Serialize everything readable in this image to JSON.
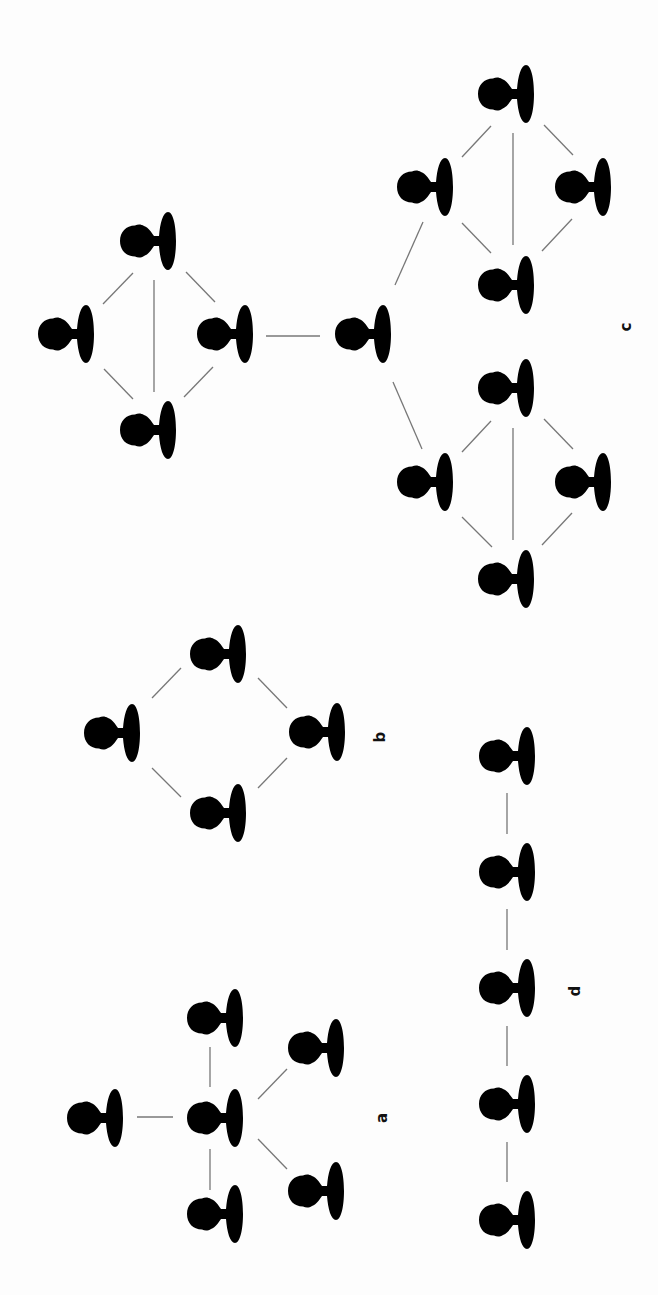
{
  "figure": {
    "orientation": "rotated -90deg",
    "node_icon": "person-silhouette-icon",
    "node_color": "#000000",
    "edge_color": "#777777",
    "background": "#ffffff"
  },
  "labels": {
    "a": "a",
    "b": "b",
    "c": "c",
    "d": "d"
  },
  "networks": [
    {
      "id": "a",
      "description": "star network",
      "nodes": [
        {
          "id": "a-left",
          "x": 94,
          "y": 1118
        },
        {
          "id": "a-center",
          "x": 214,
          "y": 1118
        },
        {
          "id": "a-top",
          "x": 214,
          "y": 1018
        },
        {
          "id": "a-bottom",
          "x": 214,
          "y": 1214
        },
        {
          "id": "a-right-top",
          "x": 315,
          "y": 1048
        },
        {
          "id": "a-right-bottom",
          "x": 315,
          "y": 1191
        }
      ],
      "edges": [
        [
          "a-center",
          "a-left"
        ],
        [
          "a-center",
          "a-top"
        ],
        [
          "a-center",
          "a-bottom"
        ],
        [
          "a-center",
          "a-right-top"
        ],
        [
          "a-center",
          "a-right-bottom"
        ]
      ]
    },
    {
      "id": "b",
      "description": "ring network",
      "nodes": [
        {
          "id": "b-top",
          "x": 217,
          "y": 654
        },
        {
          "id": "b-left",
          "x": 111,
          "y": 733
        },
        {
          "id": "b-right",
          "x": 316,
          "y": 732
        },
        {
          "id": "b-bottom",
          "x": 217,
          "y": 813
        }
      ],
      "edges": [
        [
          "b-top",
          "b-left"
        ],
        [
          "b-top",
          "b-right"
        ],
        [
          "b-left",
          "b-bottom"
        ],
        [
          "b-right",
          "b-bottom"
        ]
      ]
    },
    {
      "id": "c",
      "description": "hierarchical network of interconnected clusters",
      "nodes": [
        {
          "id": "c-hub",
          "x": 362,
          "y": 334
        },
        {
          "id": "c-l-top",
          "x": 147,
          "y": 241
        },
        {
          "id": "c-l-left",
          "x": 65,
          "y": 334
        },
        {
          "id": "c-l-right",
          "x": 224,
          "y": 334
        },
        {
          "id": "c-l-bottom",
          "x": 147,
          "y": 430
        },
        {
          "id": "c-u-top",
          "x": 505,
          "y": 94
        },
        {
          "id": "c-u-left",
          "x": 424,
          "y": 187
        },
        {
          "id": "c-u-right",
          "x": 582,
          "y": 187
        },
        {
          "id": "c-u-bottom",
          "x": 505,
          "y": 285
        },
        {
          "id": "c-d-top",
          "x": 505,
          "y": 388
        },
        {
          "id": "c-d-left",
          "x": 424,
          "y": 482
        },
        {
          "id": "c-d-right",
          "x": 582,
          "y": 482
        },
        {
          "id": "c-d-bottom",
          "x": 505,
          "y": 579
        }
      ],
      "edges": [
        [
          "c-l-top",
          "c-l-left"
        ],
        [
          "c-l-top",
          "c-l-right"
        ],
        [
          "c-l-top",
          "c-l-bottom"
        ],
        [
          "c-l-left",
          "c-l-bottom"
        ],
        [
          "c-l-right",
          "c-l-bottom"
        ],
        [
          "c-l-right",
          "c-hub"
        ],
        [
          "c-hub",
          "c-u-left"
        ],
        [
          "c-hub",
          "c-d-left"
        ],
        [
          "c-u-top",
          "c-u-left"
        ],
        [
          "c-u-top",
          "c-u-right"
        ],
        [
          "c-u-top",
          "c-u-bottom"
        ],
        [
          "c-u-left",
          "c-u-bottom"
        ],
        [
          "c-u-right",
          "c-u-bottom"
        ],
        [
          "c-d-top",
          "c-d-left"
        ],
        [
          "c-d-top",
          "c-d-right"
        ],
        [
          "c-d-top",
          "c-d-bottom"
        ],
        [
          "c-d-left",
          "c-d-bottom"
        ],
        [
          "c-d-right",
          "c-d-bottom"
        ]
      ]
    },
    {
      "id": "d",
      "description": "chain network",
      "nodes": [
        {
          "id": "d-1",
          "x": 506,
          "y": 756
        },
        {
          "id": "d-2",
          "x": 506,
          "y": 872
        },
        {
          "id": "d-3",
          "x": 506,
          "y": 988
        },
        {
          "id": "d-4",
          "x": 506,
          "y": 1104
        },
        {
          "id": "d-5",
          "x": 506,
          "y": 1220
        }
      ],
      "edges": [
        [
          "d-1",
          "d-2"
        ],
        [
          "d-2",
          "d-3"
        ],
        [
          "d-3",
          "d-4"
        ],
        [
          "d-4",
          "d-5"
        ]
      ]
    }
  ]
}
